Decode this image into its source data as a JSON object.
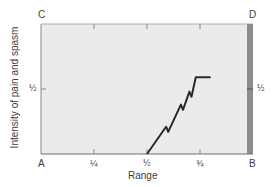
{
  "chart_data": {
    "type": "line",
    "title": "",
    "xlabel": "Range",
    "ylabel": "Intensity of pain and spasm",
    "corner_labels": {
      "top_left": "C",
      "top_right": "D",
      "bottom_left": "A",
      "bottom_right": "B"
    },
    "x_ticks": [
      "¼",
      "½",
      "¾"
    ],
    "y_ticks_left": [
      "½"
    ],
    "y_ticks_right": [
      "½"
    ],
    "xlim": [
      0,
      1
    ],
    "ylim": [
      0,
      1
    ],
    "grid": false,
    "series": [
      {
        "name": "pain and spasm",
        "x": [
          0.5,
          0.59,
          0.6,
          0.66,
          0.67,
          0.7,
          0.71,
          0.73,
          0.8
        ],
        "y": [
          0.0,
          0.21,
          0.17,
          0.38,
          0.34,
          0.48,
          0.44,
          0.59,
          0.59
        ]
      }
    ],
    "annotations": [
      {
        "type": "band",
        "x_range": [
          0.97,
          1.0
        ],
        "description": "dark vertical strip at right edge (end of range)"
      }
    ]
  },
  "colors": {
    "plot_bg": "#ebebeb",
    "end_strip": "#8c8c8c",
    "line": "#2a2a2a",
    "axis": "#6e6e6e"
  }
}
